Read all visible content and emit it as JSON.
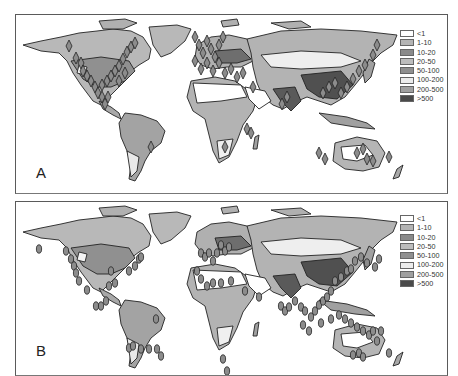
{
  "figure": {
    "panels": [
      {
        "id": "A",
        "label": "A",
        "marker_shape": "diamond",
        "legend": [
          {
            "label": "<1",
            "color": "#ffffff"
          },
          {
            "label": "1-10",
            "color": "#b4b4b4"
          },
          {
            "label": "10-20",
            "color": "#8a8a8a"
          },
          {
            "label": "20-50",
            "color": "#bdbdbd"
          },
          {
            "label": "50-100",
            "color": "#8f8f8f"
          },
          {
            "label": "100-200",
            "color": "#ececec"
          },
          {
            "label": "200-500",
            "color": "#a0a0a0"
          },
          {
            "label": ">500",
            "color": "#4a4a4a"
          }
        ]
      },
      {
        "id": "B",
        "label": "B",
        "marker_shape": "ellipse",
        "legend": [
          {
            "label": "<1",
            "color": "#ffffff"
          },
          {
            "label": "1-10",
            "color": "#b4b4b4"
          },
          {
            "label": "10-20",
            "color": "#8a8a8a"
          },
          {
            "label": "20-50",
            "color": "#bdbdbd"
          },
          {
            "label": "50-100",
            "color": "#8f8f8f"
          },
          {
            "label": "100-200",
            "color": "#ececec"
          },
          {
            "label": "200-500",
            "color": "#a0a0a0"
          },
          {
            "label": ">500",
            "color": "#4a4a4a"
          }
        ]
      }
    ],
    "markers_a": [
      [
        68,
        45
      ],
      [
        75,
        57
      ],
      [
        80,
        62
      ],
      [
        82,
        70
      ],
      [
        86,
        75
      ],
      [
        90,
        80
      ],
      [
        94,
        86
      ],
      [
        97,
        92
      ],
      [
        101,
        96
      ],
      [
        104,
        103
      ],
      [
        107,
        96
      ],
      [
        101,
        84
      ],
      [
        106,
        80
      ],
      [
        110,
        75
      ],
      [
        114,
        70
      ],
      [
        118,
        65
      ],
      [
        122,
        58
      ],
      [
        126,
        51
      ],
      [
        130,
        46
      ],
      [
        134,
        42
      ],
      [
        118,
        80
      ],
      [
        124,
        72
      ],
      [
        194,
        36
      ],
      [
        198,
        44
      ],
      [
        202,
        52
      ],
      [
        206,
        40
      ],
      [
        210,
        48
      ],
      [
        214,
        56
      ],
      [
        218,
        44
      ],
      [
        222,
        36
      ],
      [
        194,
        60
      ],
      [
        200,
        68
      ],
      [
        206,
        62
      ],
      [
        212,
        70
      ],
      [
        218,
        62
      ],
      [
        224,
        72
      ],
      [
        230,
        68
      ],
      [
        236,
        76
      ],
      [
        242,
        72
      ],
      [
        252,
        86
      ],
      [
        281,
        103
      ],
      [
        286,
        96
      ],
      [
        322,
        92
      ],
      [
        328,
        86
      ],
      [
        334,
        82
      ],
      [
        340,
        92
      ],
      [
        346,
        86
      ],
      [
        352,
        78
      ],
      [
        358,
        70
      ],
      [
        364,
        64
      ],
      [
        372,
        54
      ],
      [
        376,
        44
      ],
      [
        318,
        152
      ],
      [
        324,
        158
      ],
      [
        356,
        152
      ],
      [
        362,
        148
      ],
      [
        366,
        158
      ],
      [
        372,
        160
      ],
      [
        388,
        156
      ],
      [
        246,
        128
      ],
      [
        250,
        132
      ],
      [
        224,
        146
      ],
      [
        150,
        146
      ]
    ],
    "markers_b": [
      [
        38,
        248
      ],
      [
        65,
        250
      ],
      [
        70,
        258
      ],
      [
        73,
        265
      ],
      [
        75,
        272
      ],
      [
        78,
        280
      ],
      [
        86,
        289
      ],
      [
        95,
        305
      ],
      [
        100,
        305
      ],
      [
        105,
        300
      ],
      [
        108,
        285
      ],
      [
        110,
        270
      ],
      [
        114,
        282
      ],
      [
        128,
        270
      ],
      [
        134,
        265
      ],
      [
        138,
        258
      ],
      [
        140,
        256
      ],
      [
        155,
        318
      ],
      [
        128,
        347
      ],
      [
        132,
        345
      ],
      [
        140,
        348
      ],
      [
        148,
        348
      ],
      [
        156,
        348
      ],
      [
        160,
        355
      ],
      [
        200,
        252
      ],
      [
        204,
        256
      ],
      [
        208,
        252
      ],
      [
        212,
        260
      ],
      [
        216,
        252
      ],
      [
        220,
        244
      ],
      [
        224,
        250
      ],
      [
        228,
        246
      ],
      [
        196,
        270
      ],
      [
        200,
        278
      ],
      [
        206,
        285
      ],
      [
        212,
        282
      ],
      [
        220,
        282
      ],
      [
        230,
        280
      ],
      [
        244,
        290
      ],
      [
        258,
        296
      ],
      [
        280,
        305
      ],
      [
        284,
        310
      ],
      [
        288,
        306
      ],
      [
        294,
        300
      ],
      [
        300,
        306
      ],
      [
        304,
        310
      ],
      [
        310,
        316
      ],
      [
        314,
        310
      ],
      [
        318,
        304
      ],
      [
        322,
        300
      ],
      [
        326,
        296
      ],
      [
        330,
        290
      ],
      [
        334,
        280
      ],
      [
        340,
        276
      ],
      [
        346,
        270
      ],
      [
        350,
        268
      ],
      [
        354,
        260
      ],
      [
        360,
        256
      ],
      [
        366,
        262
      ],
      [
        374,
        266
      ],
      [
        378,
        258
      ],
      [
        302,
        324
      ],
      [
        308,
        330
      ],
      [
        320,
        322
      ],
      [
        330,
        318
      ],
      [
        338,
        314
      ],
      [
        344,
        318
      ],
      [
        350,
        322
      ],
      [
        356,
        326
      ],
      [
        362,
        330
      ],
      [
        368,
        334
      ],
      [
        372,
        330
      ],
      [
        380,
        330
      ],
      [
        376,
        340
      ],
      [
        222,
        358
      ],
      [
        226,
        370
      ],
      [
        352,
        354
      ],
      [
        358,
        352
      ],
      [
        362,
        356
      ],
      [
        388,
        352
      ]
    ]
  }
}
